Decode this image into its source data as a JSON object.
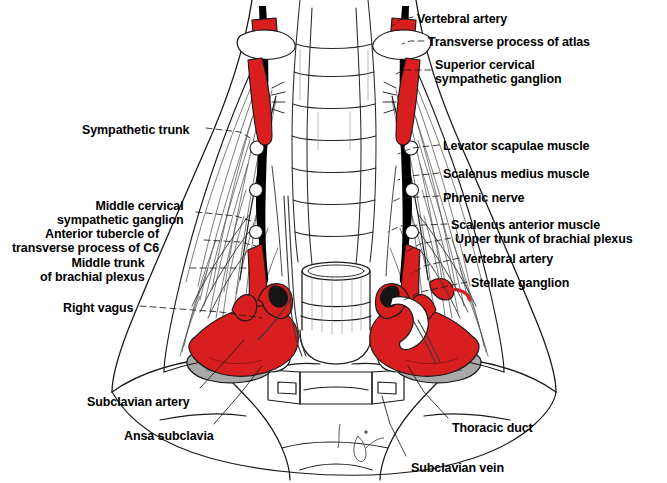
{
  "figure": {
    "colors": {
      "artery_red": "#D81E1E",
      "bone_gray": "#A9A9A9",
      "outline": "#1a1a1a",
      "trunk_black": "#000000",
      "background": "#FFFFFF",
      "fine_line": "#6f6f6f"
    },
    "signature": "G."
  },
  "labels_right": [
    {
      "id": "vertebral-artery-top",
      "text": "Vertebral artery",
      "x": 417,
      "y": 12
    },
    {
      "id": "transverse-process-atlas",
      "text": "Transverse process of atlas",
      "x": 428,
      "y": 35
    },
    {
      "id": "superior-cervical-sympathetic-ganglion",
      "text": "Superior cervical\nsympathetic ganglion",
      "x": 435,
      "y": 58
    },
    {
      "id": "levator-scapulae-muscle",
      "text": "Levator scapulae muscle",
      "x": 443,
      "y": 139
    },
    {
      "id": "scalenus-medius-muscle",
      "text": "Scalenus medius muscle",
      "x": 443,
      "y": 167
    },
    {
      "id": "phrenic-nerve",
      "text": "Phrenic nerve",
      "x": 443,
      "y": 191
    },
    {
      "id": "scalenus-anterior-muscle",
      "text": "Scalenus anterior muscle",
      "x": 451,
      "y": 218
    },
    {
      "id": "upper-trunk-brachial-plexus",
      "text": "Upper trunk of brachial plexus",
      "x": 455,
      "y": 232
    },
    {
      "id": "vertebral-artery-lower",
      "text": "Vertebral artery",
      "x": 463,
      "y": 252
    },
    {
      "id": "stellate-ganglion",
      "text": "Stellate ganglion",
      "x": 471,
      "y": 276
    }
  ],
  "labels_left": [
    {
      "id": "sympathetic-trunk",
      "text": "Sympathetic trunk",
      "x": 82,
      "y": 123
    },
    {
      "id": "middle-cervical-sympathetic-ganglion",
      "text": "Middle cervical\nsympathetic ganglion",
      "x": 57,
      "y": 199
    },
    {
      "id": "anterior-tubercle-c6",
      "text": "Anterior tubercle of\ntransverse process of C6",
      "x": 12,
      "y": 227
    },
    {
      "id": "middle-trunk-brachial-plexus",
      "text": "Middle trunk\nof brachial plexus",
      "x": 40,
      "y": 256
    },
    {
      "id": "right-vagus",
      "text": "Right vagus",
      "x": 63,
      "y": 301
    }
  ],
  "labels_bottom": [
    {
      "id": "subclavian-artery",
      "text": "Subclavian artery",
      "x": 87,
      "y": 395
    },
    {
      "id": "ansa-subclavia",
      "text": "Ansa subclavia",
      "x": 124,
      "y": 429
    },
    {
      "id": "thoracic-duct",
      "text": "Thoracic duct",
      "x": 452,
      "y": 421
    },
    {
      "id": "subclavian-vein",
      "text": "Subclavian vein",
      "x": 411,
      "y": 461
    }
  ],
  "structures": [
    "vertebral artery",
    "transverse process of atlas",
    "superior cervical sympathetic ganglion",
    "sympathetic trunk",
    "levator scapulae muscle",
    "scalenus medius muscle",
    "phrenic nerve",
    "scalenus anterior muscle",
    "upper trunk of brachial plexus",
    "middle trunk of brachial plexus",
    "middle cervical sympathetic ganglion",
    "anterior tubercle of transverse process of C6",
    "stellate ganglion",
    "right vagus",
    "subclavian artery",
    "subclavian vein",
    "ansa subclavia",
    "thoracic duct",
    "trachea",
    "clavicle",
    "cervical vertebrae"
  ]
}
